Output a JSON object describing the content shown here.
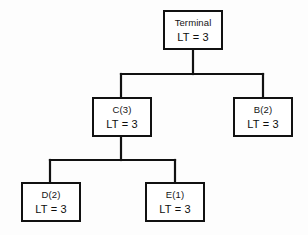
{
  "diagram": {
    "type": "tree",
    "background_color": "#fdfdfd",
    "line_color": "#111111",
    "node_fill": "#ffffff",
    "nodes": [
      {
        "id": "terminal",
        "title": "Terminal",
        "lt": "LT = 3"
      },
      {
        "id": "c",
        "title": "C(3)",
        "lt": "LT = 3"
      },
      {
        "id": "b",
        "title": "B(2)",
        "lt": "LT = 3"
      },
      {
        "id": "d",
        "title": "D(2)",
        "lt": "LT = 3"
      },
      {
        "id": "e",
        "title": "E(1)",
        "lt": "LT = 3"
      }
    ],
    "edges": [
      {
        "from": "terminal",
        "to": "c"
      },
      {
        "from": "terminal",
        "to": "b"
      },
      {
        "from": "c",
        "to": "d"
      },
      {
        "from": "c",
        "to": "e"
      }
    ]
  }
}
